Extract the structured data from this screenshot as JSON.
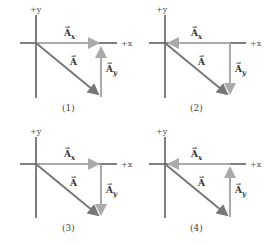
{
  "figure": {
    "axis_labels": {
      "x": "+x",
      "y": "+y"
    },
    "vector_labels": {
      "A": "A",
      "Ax": "A",
      "Ax_sub": "x",
      "Ay": "A",
      "Ay_sub": "y",
      "arrow": "→"
    },
    "colors": {
      "axes": "#555555",
      "resultant": "#777777",
      "components": "#aaaaaa"
    },
    "panels": [
      {
        "caption": "(1)",
        "ax_direction": "right",
        "ay_direction": "up"
      },
      {
        "caption": "(2)",
        "ax_direction": "left",
        "ay_direction": "down"
      },
      {
        "caption": "(3)",
        "ax_direction": "right",
        "ay_direction": "down"
      },
      {
        "caption": "(4)",
        "ax_direction": "left",
        "ay_direction": "up"
      }
    ]
  }
}
